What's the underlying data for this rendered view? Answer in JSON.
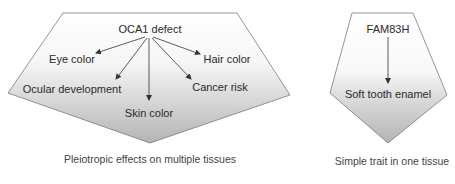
{
  "diagram": {
    "colors": {
      "shape_top": "#ffffff",
      "shape_bottom": "#b4b4b4",
      "outline": "#7a7a7a",
      "arrow": "#333333",
      "text": "#2a2a2a",
      "caption": "#444444"
    },
    "left_panel": {
      "source": "OCA1 defect",
      "effects": [
        "Eye color",
        "Ocular development",
        "Skin color",
        "Cancer risk",
        "Hair color"
      ],
      "caption": "Pleiotropic effects on multiple tissues"
    },
    "right_panel": {
      "source": "FAM83H",
      "effect": "Soft tooth enamel",
      "caption": "Simple trait in one tissue"
    }
  }
}
